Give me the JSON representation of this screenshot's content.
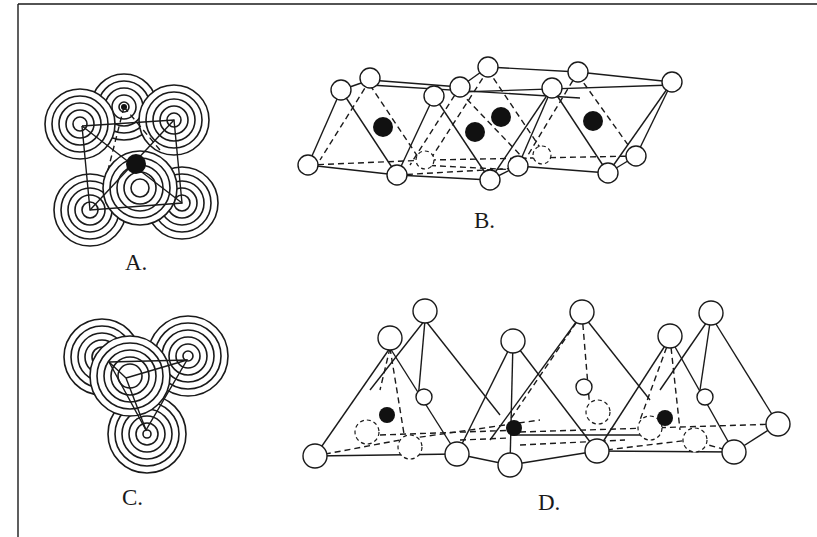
{
  "figure": {
    "panels": [
      {
        "id": "A",
        "label": "A.",
        "description": "Octahedral packing of six anions around a central cation (concentric-circle sphere representation)"
      },
      {
        "id": "B",
        "label": "B.",
        "description": "Chain/sheet of edge-sharing octahedra with cations at centers"
      },
      {
        "id": "C",
        "label": "C.",
        "description": "Tetrahedral packing of four anions (concentric-circle sphere representation)"
      },
      {
        "id": "D",
        "label": "D.",
        "description": "Chain of corner-sharing tetrahedra with cations at centers"
      }
    ],
    "legend_symbols": {
      "anion": "open-circle",
      "cation": "filled-circle"
    },
    "colors": {
      "ink": "#1a1a1a",
      "background": "#ffffff"
    }
  }
}
